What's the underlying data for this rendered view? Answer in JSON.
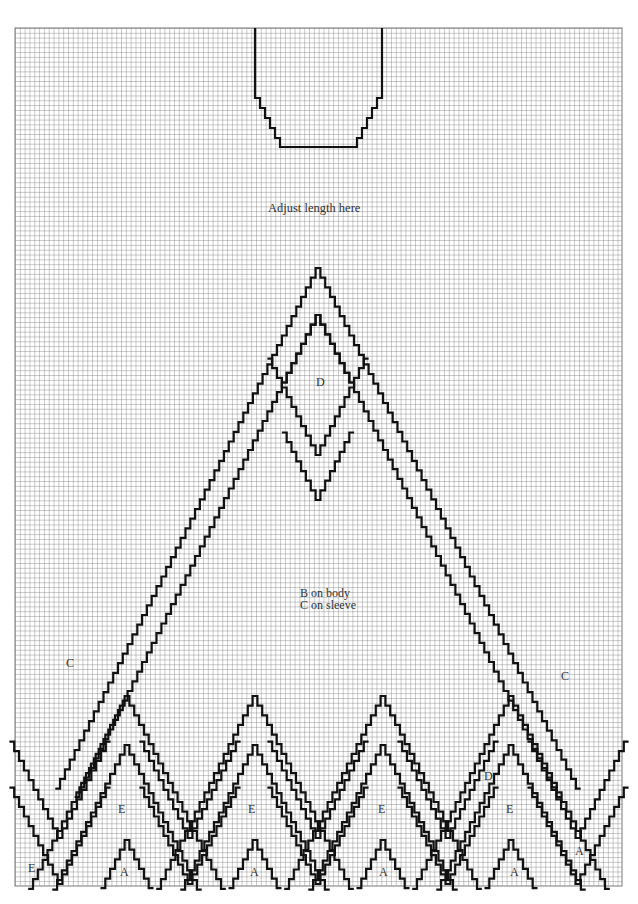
{
  "chart": {
    "grid": {
      "x0": 15,
      "y0": 28,
      "x1": 622,
      "y1": 886,
      "cell": 4.82
    },
    "colors": {
      "grid_line": "#7a7a7a",
      "pattern_line": "#111111",
      "background": "#ffffff"
    }
  },
  "annotations": {
    "adjust_length": "Adjust length here",
    "body_line1": "B on body",
    "body_line2": "C on sleeve",
    "diamond_label": "D",
    "left_c": "C",
    "right_c": "C",
    "e_labels": [
      "E",
      "E",
      "E",
      "E"
    ],
    "a_labels": [
      "A",
      "A",
      "A",
      "A"
    ],
    "corner_e": "E",
    "right_a": "A",
    "small_d": "D"
  },
  "chart_data": {
    "type": "diagram",
    "regions": [
      {
        "label": "A",
        "description": "Small bottom triangles (colour A)"
      },
      {
        "label": "B",
        "description": "Main field on body"
      },
      {
        "label": "C",
        "description": "Main field on sleeve / outer fields"
      },
      {
        "label": "D",
        "description": "Central diamond and band colour"
      },
      {
        "label": "E",
        "description": "Zigzag band colour"
      }
    ],
    "notes": [
      "Adjust length here",
      "B on body",
      "C on sleeve"
    ],
    "grid_columns": 126,
    "grid_rows": 178
  }
}
